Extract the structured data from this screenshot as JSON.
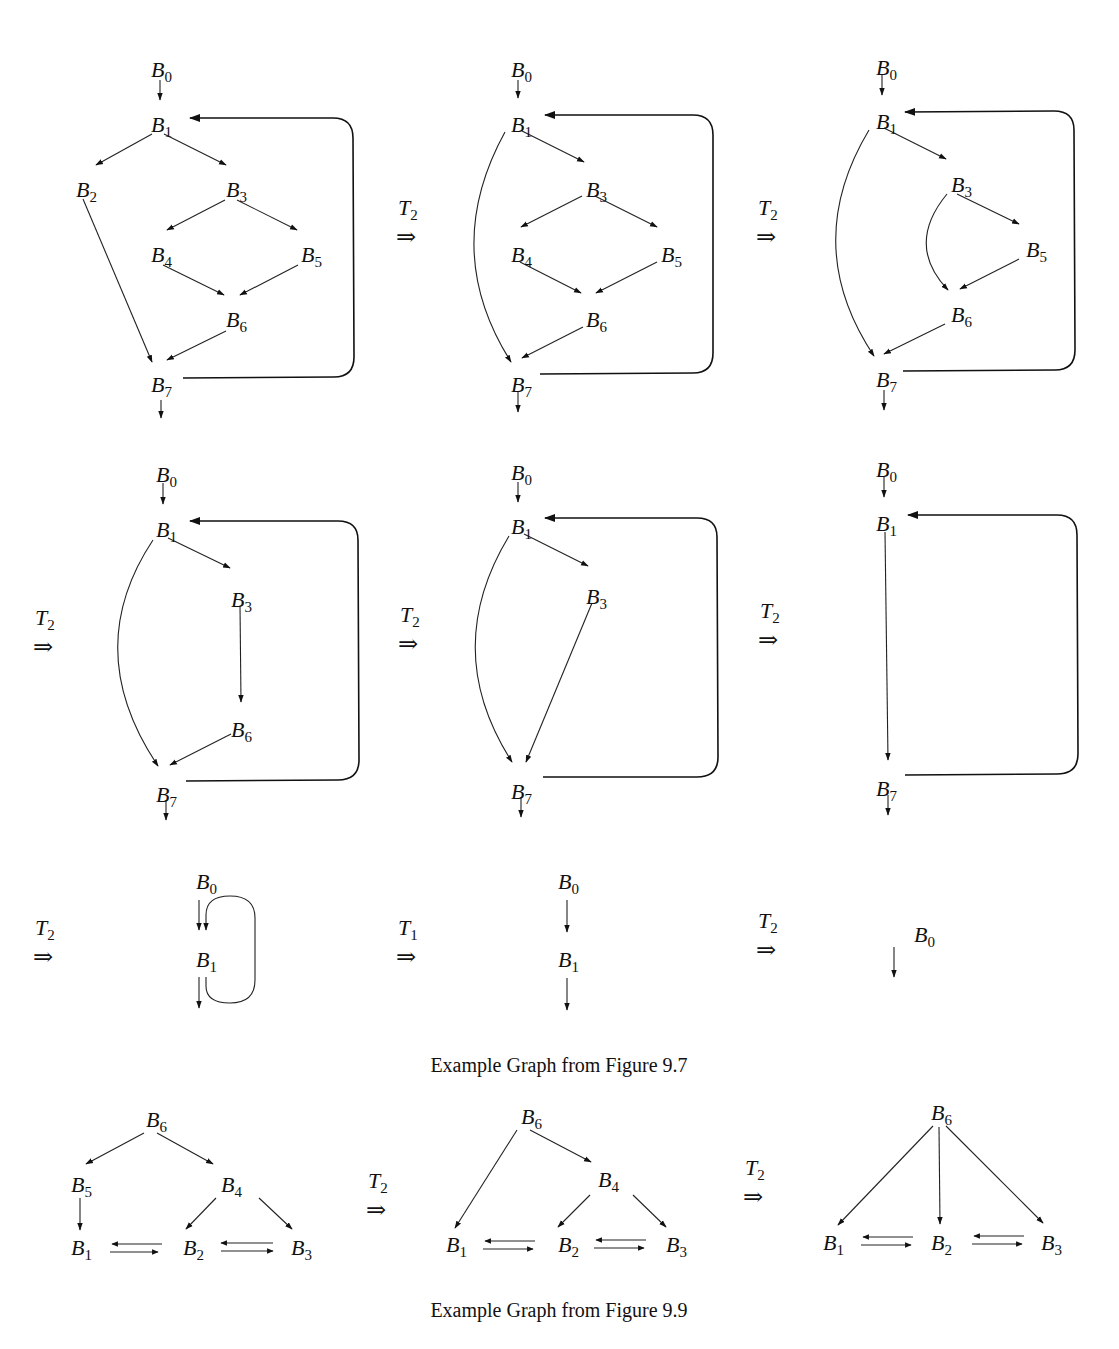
{
  "figure": {
    "caption_1": "Example Graph from Figure 9.7",
    "caption_2": "Example Graph from Figure 9.9",
    "transform_arrow": "⇒",
    "ink_color": "#111111",
    "background": "#ffffff"
  },
  "panels_fig97": [
    {
      "id": "p1",
      "transform": null,
      "nodes": [
        {
          "name": "B",
          "sub": "0",
          "x": 160,
          "y": 70
        },
        {
          "name": "B",
          "sub": "1",
          "x": 160,
          "y": 125
        },
        {
          "name": "B",
          "sub": "2",
          "x": 85,
          "y": 190
        },
        {
          "name": "B",
          "sub": "3",
          "x": 235,
          "y": 190
        },
        {
          "name": "B",
          "sub": "4",
          "x": 160,
          "y": 255
        },
        {
          "name": "B",
          "sub": "5",
          "x": 310,
          "y": 255
        },
        {
          "name": "B",
          "sub": "6",
          "x": 235,
          "y": 320
        },
        {
          "name": "B",
          "sub": "7",
          "x": 160,
          "y": 385
        }
      ],
      "edges": [
        [
          "B0",
          "B1"
        ],
        [
          "B1",
          "B2"
        ],
        [
          "B1",
          "B3"
        ],
        [
          "B2",
          "B7"
        ],
        [
          "B3",
          "B4"
        ],
        [
          "B3",
          "B5"
        ],
        [
          "B4",
          "B6"
        ],
        [
          "B5",
          "B6"
        ],
        [
          "B6",
          "B7"
        ],
        [
          "B7",
          "B1",
          "back"
        ],
        [
          "B7",
          "exit"
        ]
      ]
    },
    {
      "id": "p2",
      "transform": "T2",
      "nodes": [
        {
          "name": "B",
          "sub": "0",
          "x": 520,
          "y": 70
        },
        {
          "name": "B",
          "sub": "1",
          "x": 520,
          "y": 125
        },
        {
          "name": "B",
          "sub": "3",
          "x": 595,
          "y": 190
        },
        {
          "name": "B",
          "sub": "4",
          "x": 520,
          "y": 255
        },
        {
          "name": "B",
          "sub": "5",
          "x": 670,
          "y": 255
        },
        {
          "name": "B",
          "sub": "6",
          "x": 595,
          "y": 320
        },
        {
          "name": "B",
          "sub": "7",
          "x": 520,
          "y": 385
        }
      ],
      "edges": [
        [
          "B0",
          "B1"
        ],
        [
          "B1",
          "B7",
          "curve"
        ],
        [
          "B1",
          "B3"
        ],
        [
          "B3",
          "B4"
        ],
        [
          "B3",
          "B5"
        ],
        [
          "B4",
          "B6"
        ],
        [
          "B5",
          "B6"
        ],
        [
          "B6",
          "B7"
        ],
        [
          "B7",
          "B1",
          "back"
        ],
        [
          "B7",
          "exit"
        ]
      ]
    },
    {
      "id": "p3",
      "transform": "T2",
      "nodes": [
        {
          "name": "B",
          "sub": "0",
          "x": 885,
          "y": 68
        },
        {
          "name": "B",
          "sub": "1",
          "x": 885,
          "y": 122
        },
        {
          "name": "B",
          "sub": "3",
          "x": 960,
          "y": 185
        },
        {
          "name": "B",
          "sub": "5",
          "x": 1035,
          "y": 250
        },
        {
          "name": "B",
          "sub": "6",
          "x": 960,
          "y": 315
        },
        {
          "name": "B",
          "sub": "7",
          "x": 885,
          "y": 380
        }
      ],
      "edges": [
        [
          "B0",
          "B1"
        ],
        [
          "B1",
          "B7",
          "curve"
        ],
        [
          "B1",
          "B3"
        ],
        [
          "B3",
          "B6",
          "curve"
        ],
        [
          "B3",
          "B5"
        ],
        [
          "B5",
          "B6"
        ],
        [
          "B6",
          "B7"
        ],
        [
          "B7",
          "B1",
          "back"
        ],
        [
          "B7",
          "exit"
        ]
      ]
    },
    {
      "id": "p4",
      "transform": "T2",
      "nodes": [
        {
          "name": "B",
          "sub": "0",
          "x": 165,
          "y": 475
        },
        {
          "name": "B",
          "sub": "1",
          "x": 165,
          "y": 530
        },
        {
          "name": "B",
          "sub": "3",
          "x": 240,
          "y": 600
        },
        {
          "name": "B",
          "sub": "6",
          "x": 240,
          "y": 730
        },
        {
          "name": "B",
          "sub": "7",
          "x": 165,
          "y": 795
        }
      ],
      "edges": [
        [
          "B0",
          "B1"
        ],
        [
          "B1",
          "B7",
          "curve"
        ],
        [
          "B1",
          "B3"
        ],
        [
          "B3",
          "B6"
        ],
        [
          "B6",
          "B7"
        ],
        [
          "B7",
          "B1",
          "back"
        ],
        [
          "B7",
          "exit"
        ]
      ]
    },
    {
      "id": "p5",
      "transform": "T2",
      "nodes": [
        {
          "name": "B",
          "sub": "0",
          "x": 520,
          "y": 473
        },
        {
          "name": "B",
          "sub": "1",
          "x": 520,
          "y": 527
        },
        {
          "name": "B",
          "sub": "3",
          "x": 595,
          "y": 597
        },
        {
          "name": "B",
          "sub": "7",
          "x": 520,
          "y": 792
        }
      ],
      "edges": [
        [
          "B0",
          "B1"
        ],
        [
          "B1",
          "B7",
          "curve"
        ],
        [
          "B1",
          "B3"
        ],
        [
          "B3",
          "B7"
        ],
        [
          "B7",
          "B1",
          "back"
        ],
        [
          "B7",
          "exit"
        ]
      ]
    },
    {
      "id": "p6",
      "transform": "T2",
      "nodes": [
        {
          "name": "B",
          "sub": "0",
          "x": 885,
          "y": 470
        },
        {
          "name": "B",
          "sub": "1",
          "x": 885,
          "y": 524
        },
        {
          "name": "B",
          "sub": "7",
          "x": 885,
          "y": 789
        }
      ],
      "edges": [
        [
          "B0",
          "B1"
        ],
        [
          "B1",
          "B7"
        ],
        [
          "B7",
          "B1",
          "back"
        ],
        [
          "B7",
          "exit"
        ]
      ]
    },
    {
      "id": "p7",
      "transform": "T2",
      "nodes": [
        {
          "name": "B",
          "sub": "0",
          "x": 205,
          "y": 882
        },
        {
          "name": "B",
          "sub": "1",
          "x": 205,
          "y": 960
        }
      ],
      "edges": [
        [
          "B0",
          "B1"
        ],
        [
          "B1",
          "B1",
          "self-loop"
        ],
        [
          "B1",
          "exit"
        ]
      ]
    },
    {
      "id": "p8",
      "transform": "T1",
      "nodes": [
        {
          "name": "B",
          "sub": "0",
          "x": 567,
          "y": 882
        },
        {
          "name": "B",
          "sub": "1",
          "x": 567,
          "y": 960
        }
      ],
      "edges": [
        [
          "B0",
          "B1"
        ],
        [
          "B1",
          "exit"
        ]
      ]
    },
    {
      "id": "p9",
      "transform": "T2",
      "nodes": [
        {
          "name": "B",
          "sub": "0",
          "x": 923,
          "y": 935
        }
      ],
      "edges": [
        [
          "B0",
          "exit"
        ]
      ]
    }
  ],
  "panels_fig99": [
    {
      "id": "q1",
      "transform": null,
      "nodes": [
        {
          "name": "B",
          "sub": "6",
          "x": 155,
          "y": 1120
        },
        {
          "name": "B",
          "sub": "5",
          "x": 80,
          "y": 1185
        },
        {
          "name": "B",
          "sub": "4",
          "x": 230,
          "y": 1185
        },
        {
          "name": "B",
          "sub": "1",
          "x": 80,
          "y": 1248
        },
        {
          "name": "B",
          "sub": "2",
          "x": 192,
          "y": 1248
        },
        {
          "name": "B",
          "sub": "3",
          "x": 300,
          "y": 1248
        }
      ],
      "edges": [
        [
          "B6",
          "B5"
        ],
        [
          "B6",
          "B4"
        ],
        [
          "B5",
          "B1"
        ],
        [
          "B4",
          "B2"
        ],
        [
          "B4",
          "B3"
        ],
        [
          "B1",
          "B2",
          "bidir"
        ],
        [
          "B2",
          "B3",
          "bidir"
        ]
      ]
    },
    {
      "id": "q2",
      "transform": "T2",
      "nodes": [
        {
          "name": "B",
          "sub": "6",
          "x": 530,
          "y": 1117
        },
        {
          "name": "B",
          "sub": "4",
          "x": 607,
          "y": 1180
        },
        {
          "name": "B",
          "sub": "1",
          "x": 455,
          "y": 1245
        },
        {
          "name": "B",
          "sub": "2",
          "x": 567,
          "y": 1245
        },
        {
          "name": "B",
          "sub": "3",
          "x": 675,
          "y": 1245
        }
      ],
      "edges": [
        [
          "B6",
          "B1"
        ],
        [
          "B6",
          "B4"
        ],
        [
          "B4",
          "B2"
        ],
        [
          "B4",
          "B3"
        ],
        [
          "B1",
          "B2",
          "bidir"
        ],
        [
          "B2",
          "B3",
          "bidir"
        ]
      ]
    },
    {
      "id": "q3",
      "transform": "T2",
      "nodes": [
        {
          "name": "B",
          "sub": "6",
          "x": 940,
          "y": 1113
        },
        {
          "name": "B",
          "sub": "1",
          "x": 832,
          "y": 1243
        },
        {
          "name": "B",
          "sub": "2",
          "x": 940,
          "y": 1243
        },
        {
          "name": "B",
          "sub": "3",
          "x": 1050,
          "y": 1243
        }
      ],
      "edges": [
        [
          "B6",
          "B1"
        ],
        [
          "B6",
          "B2"
        ],
        [
          "B6",
          "B3"
        ],
        [
          "B1",
          "B2",
          "bidir"
        ],
        [
          "B2",
          "B3",
          "bidir"
        ]
      ]
    }
  ],
  "transforms": [
    {
      "label": "T",
      "sub": "2",
      "x": 398,
      "y": 215
    },
    {
      "label": "T",
      "sub": "2",
      "x": 758,
      "y": 215
    },
    {
      "label": "T",
      "sub": "2",
      "x": 35,
      "y": 625
    },
    {
      "label": "T",
      "sub": "2",
      "x": 400,
      "y": 622
    },
    {
      "label": "T",
      "sub": "2",
      "x": 760,
      "y": 618
    },
    {
      "label": "T",
      "sub": "2",
      "x": 35,
      "y": 935
    },
    {
      "label": "T",
      "sub": "1",
      "x": 398,
      "y": 935
    },
    {
      "label": "T",
      "sub": "2",
      "x": 758,
      "y": 928
    },
    {
      "label": "T",
      "sub": "2",
      "x": 368,
      "y": 1188
    },
    {
      "label": "T",
      "sub": "2",
      "x": 745,
      "y": 1175
    }
  ]
}
